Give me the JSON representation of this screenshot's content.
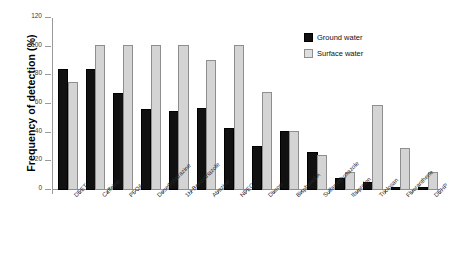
{
  "chart_data": {
    "type": "bar",
    "title": "",
    "xlabel": "",
    "ylabel": "Frequency of detection (%)",
    "ylim": [
      0,
      120
    ],
    "yticks": [
      0,
      20,
      40,
      60,
      80,
      100,
      120
    ],
    "ytick_labels": [
      "0",
      "20",
      "40",
      "60",
      "80",
      "100",
      "120"
    ],
    "grid": false,
    "legend_position": "upper-right",
    "categories": [
      "DEET",
      "Caffeine",
      "PFOA",
      "Desethylatrazine",
      "1H-Benzotriazole",
      "Atrazine",
      "NPEC",
      "Diuron",
      "Bisphenol A",
      "Sulfamethoxazole",
      "Ibuprofen",
      "Triclosan",
      "Fluoranthene",
      "DEHP"
    ],
    "series": [
      {
        "name": "Ground water",
        "color": "#111111",
        "values": [
          83,
          83,
          66,
          55,
          54,
          56,
          42,
          29,
          40,
          25,
          7,
          4,
          1,
          1
        ]
      },
      {
        "name": "Surface water",
        "color": "#d4d4d4",
        "values": [
          74,
          100,
          100,
          100,
          100,
          89,
          100,
          67,
          40,
          23,
          11,
          58,
          28,
          11
        ]
      }
    ]
  },
  "legend": {
    "items": [
      {
        "label": "Ground water",
        "swatch": "ground"
      },
      {
        "label": "Surface water",
        "swatch": "surface"
      }
    ]
  }
}
